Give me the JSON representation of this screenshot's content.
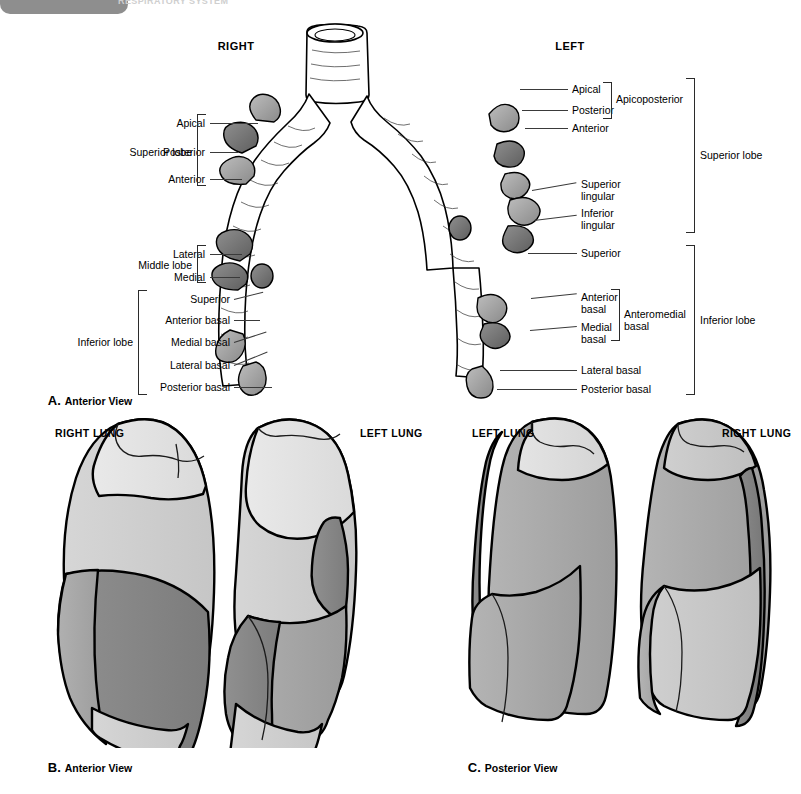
{
  "header": {
    "page_number": "",
    "title_ghost": "RESPIRATORY SYSTEM"
  },
  "panel_a": {
    "caption_letter": "A.",
    "caption_text": "Anterior View",
    "side_headers": {
      "right": "RIGHT",
      "left": "LEFT"
    },
    "right_tree": {
      "groups": [
        {
          "group_label": "Superior lobe",
          "segments": [
            "Apical",
            "Posterior",
            "Anterior"
          ]
        },
        {
          "group_label": "Middle lobe",
          "segments": [
            "Lateral",
            "Medial"
          ]
        },
        {
          "group_label": "Inferior lobe",
          "segments": [
            "Superior",
            "Anterior basal",
            "Medial basal",
            "Lateral basal",
            "Posterior basal"
          ]
        }
      ]
    },
    "left_tree": {
      "groups": [
        {
          "group_label": "Superior lobe",
          "segments": [
            "Apical",
            "Posterior",
            "Anterior",
            "Superior\nlingular",
            "Inferior\nlingular"
          ],
          "subgroup_label": "Apicoposterior",
          "subgroup_segments": [
            "Apical",
            "Posterior"
          ]
        },
        {
          "group_label": "Inferior lobe",
          "segments": [
            "Superior",
            "Anterior\nbasal",
            "Medial\nbasal",
            "Lateral basal",
            "Posterior basal"
          ],
          "subgroup_label": "Anteromedial\nbasal",
          "subgroup_segments": [
            "Anterior basal",
            "Medial basal"
          ]
        }
      ]
    }
  },
  "panel_b": {
    "caption_letter": "B.",
    "caption_text": "Anterior View",
    "lungs": [
      {
        "label": "RIGHT LUNG"
      },
      {
        "label": "LEFT LUNG"
      }
    ]
  },
  "panel_c": {
    "caption_letter": "C.",
    "caption_text": "Posterior View",
    "lungs": [
      {
        "label": "LEFT LUNG"
      },
      {
        "label": "RIGHT LUNG"
      }
    ]
  },
  "colors": {
    "outline": "#000000",
    "shade_lightest": "#e6e6e6",
    "shade_light": "#d2d2d2",
    "shade_mid": "#a9a9a9",
    "shade_dark": "#808080",
    "shade_darkest": "#5e5e5e",
    "page_tab": "#8e8e8e",
    "leader_line": "#3a3a3a"
  }
}
